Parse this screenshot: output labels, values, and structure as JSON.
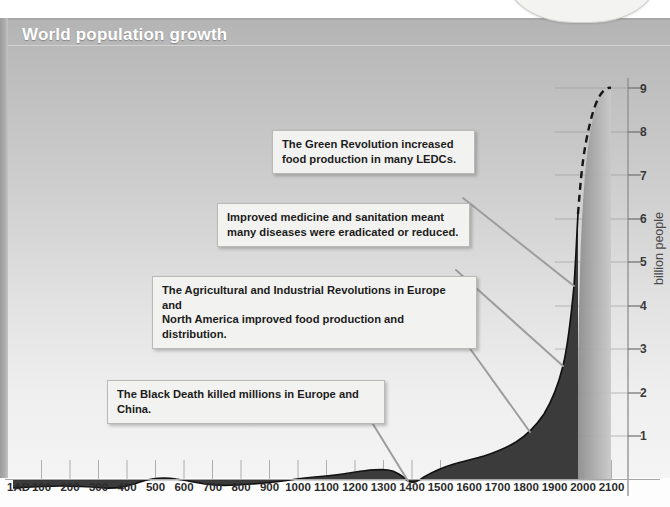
{
  "panel": {
    "title": "World population growth",
    "bubble_text": "…you think\nabout it!"
  },
  "chart_data": {
    "type": "area",
    "title": "World population growth",
    "xlabel": "",
    "ylabel": "billion people",
    "xlim": [
      1,
      2100
    ],
    "ylim": [
      0,
      9
    ],
    "grid": true,
    "legend": "none",
    "x_ticks": [
      "1AD",
      "100",
      "200",
      "300",
      "400",
      "500",
      "600",
      "700",
      "800",
      "900",
      "1000",
      "1100",
      "1200",
      "1300",
      "1400",
      "1500",
      "1600",
      "1700",
      "1800",
      "1900",
      "2000",
      "2100"
    ],
    "y_ticks": [
      1,
      2,
      3,
      4,
      5,
      6,
      7,
      8,
      9
    ],
    "series": [
      {
        "name": "World population (historical)",
        "style": "solid",
        "x": [
          1,
          200,
          400,
          500,
          600,
          800,
          1000,
          1100,
          1200,
          1300,
          1340,
          1400,
          1500,
          1600,
          1700,
          1750,
          1800,
          1850,
          1900,
          1927,
          1950,
          1960,
          1975,
          1987,
          1999,
          2000
        ],
        "values": [
          0.2,
          0.22,
          0.19,
          0.21,
          0.21,
          0.22,
          0.26,
          0.3,
          0.36,
          0.4,
          0.44,
          0.35,
          0.45,
          0.55,
          0.6,
          0.75,
          0.95,
          1.25,
          1.65,
          2.0,
          2.55,
          3.0,
          4.0,
          5.0,
          5.95,
          6.1
        ]
      },
      {
        "name": "Projection",
        "style": "dashed",
        "x": [
          2000,
          2010,
          2020,
          2030,
          2040,
          2050
        ],
        "values": [
          6.1,
          6.9,
          7.7,
          8.3,
          8.75,
          9.0
        ]
      }
    ],
    "annotations": [
      {
        "id": "green-revolution",
        "text": "The Green Revolution increased\nfood production in many LEDCs.",
        "points_to_year": 1970
      },
      {
        "id": "medicine-sanitation",
        "text": "Improved medicine and sanitation meant\nmany diseases were eradicated or reduced.",
        "points_to_year": 1920
      },
      {
        "id": "agricultural-industrial",
        "text": "The Agricultural and Industrial Revolutions in Europe and\nNorth America improved food production and distribution.",
        "points_to_year": 1820
      },
      {
        "id": "black-death",
        "text": "The Black Death killed millions in Europe and China.",
        "points_to_year": 1350
      }
    ]
  },
  "annotations": {
    "green_revolution": "The Green Revolution increased\nfood production in many LEDCs.",
    "medicine_sanitation": "Improved medicine and sanitation meant\nmany diseases were eradicated or reduced.",
    "agricultural_industrial": "The Agricultural and Industrial Revolutions in Europe and\nNorth America improved food production and distribution.",
    "black_death": "The Black Death killed millions in Europe and China."
  },
  "colors": {
    "panel_top": "#b4b4b4",
    "panel_bottom": "#f4f4f4",
    "area_fill": "#3a3a3a",
    "projection_fill": "#9a9a9a",
    "callout_bg": "#f2f2f0",
    "curve": "#1a1a1a",
    "grid": "#a8a8a8"
  }
}
